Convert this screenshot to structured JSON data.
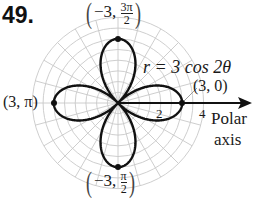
{
  "problem_number": "49.",
  "chart_data": {
    "type": "line",
    "subtype": "polar",
    "title": "",
    "equation": "r = 3 cos 2θ",
    "series": [
      {
        "name": "r = 3 cos 2θ",
        "function": "3*cos(2*theta)",
        "theta_range": [
          0,
          6.283185
        ],
        "color": "#111111"
      }
    ],
    "points": [
      {
        "label": "(3, 0)",
        "r": 3,
        "theta": 0
      },
      {
        "label": "(3, π)",
        "r": 3,
        "theta": "π"
      },
      {
        "label": "(−3, 3π/2)",
        "r": -3,
        "theta": "3π/2"
      },
      {
        "label": "(−3, π/2)",
        "r": -3,
        "theta": "π/2"
      }
    ],
    "radial_tick_labels": [
      "2",
      "4"
    ],
    "radial_range": [
      0,
      4
    ],
    "grid": true,
    "axis_label": "Polar axis"
  },
  "labels": {
    "equation_lhs": "r = 3 cos 2θ",
    "pt_right": "(3, 0)",
    "pt_left": "(3, π)",
    "pt_top_r": "−3,",
    "pt_top_num": "3π",
    "pt_top_den": "2",
    "pt_bottom_r": "−3,",
    "pt_bottom_num": "π",
    "pt_bottom_den": "2",
    "tick_2": "2",
    "tick_4": "4",
    "axis_line1": "Polar",
    "axis_line2": "axis"
  },
  "colors": {
    "grid": "#c8c8c8",
    "curve": "#111111",
    "axis": "#111111"
  }
}
